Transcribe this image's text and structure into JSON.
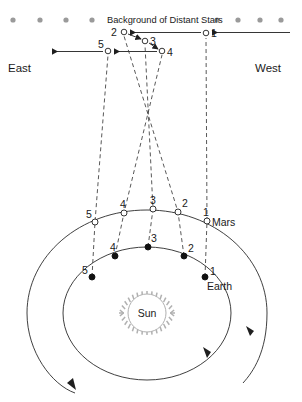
{
  "diagram": {
    "title": "Background of Distant Stars",
    "directions": {
      "east": "East",
      "west": "West"
    },
    "sun_label": "Sun",
    "mars_label": "Mars",
    "earth_label": "Earth",
    "sky_positions": [
      {
        "num": "1",
        "cx": 206,
        "cy": 33,
        "label_x": 211,
        "label_y": 37
      },
      {
        "num": "2",
        "cx": 124,
        "cy": 32,
        "label_x": 111,
        "label_y": 36
      },
      {
        "num": "3",
        "cx": 145,
        "cy": 41,
        "label_x": 150,
        "label_y": 45
      },
      {
        "num": "4",
        "cx": 162,
        "cy": 51,
        "label_x": 167,
        "label_y": 56
      },
      {
        "num": "5",
        "cx": 108,
        "cy": 51,
        "label_x": 98,
        "label_y": 48
      }
    ],
    "mars_positions": [
      {
        "num": "1",
        "cx": 207,
        "cy": 221,
        "label_x": 203,
        "label_y": 216
      },
      {
        "num": "2",
        "cx": 178,
        "cy": 212,
        "label_x": 182,
        "label_y": 207
      },
      {
        "num": "3",
        "cx": 153,
        "cy": 209,
        "label_x": 150,
        "label_y": 204
      },
      {
        "num": "4",
        "cx": 124,
        "cy": 213,
        "label_x": 120,
        "label_y": 208
      },
      {
        "num": "5",
        "cx": 95,
        "cy": 222,
        "label_x": 88,
        "label_y": 218
      }
    ],
    "earth_positions": [
      {
        "num": "1",
        "cx": 205,
        "cy": 277,
        "label_x": 210,
        "label_y": 275
      },
      {
        "num": "2",
        "cx": 184,
        "cy": 256,
        "label_x": 188,
        "label_y": 252
      },
      {
        "num": "3",
        "cx": 148,
        "cy": 247,
        "label_x": 151,
        "label_y": 242
      },
      {
        "num": "4",
        "cx": 115,
        "cy": 256,
        "label_x": 110,
        "label_y": 251
      },
      {
        "num": "5",
        "cx": 92,
        "cy": 277,
        "label_x": 84,
        "label_y": 274
      }
    ],
    "colors": {
      "star": "#9a9a9a",
      "line": "#1f1f1f",
      "sight": "#3a3a3a",
      "sun": "#b0b0b0",
      "text": "#1a1a1a"
    },
    "star_row": {
      "y": 20,
      "left_x": [
        13,
        40,
        66,
        92
      ],
      "right_x": [
        217,
        238,
        260,
        281
      ],
      "radius": 2.6
    }
  }
}
